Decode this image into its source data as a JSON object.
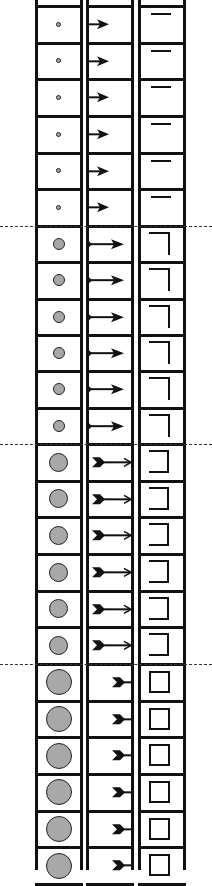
{
  "diagram": {
    "colors": {
      "line": "#111111",
      "dot_fill": "#a8a8a8",
      "background": "#ffffff"
    },
    "columns": [
      {
        "name": "circle-column",
        "x_left": 36,
        "x_right": 81
      },
      {
        "name": "arrow-column",
        "x_left": 87,
        "x_right": 132
      },
      {
        "name": "shape-column",
        "x_left": 139,
        "x_right": 184
      }
    ],
    "dividers_y": [
      226,
      444,
      664
    ],
    "groups": [
      {
        "stage": 1,
        "rows": 6,
        "circle_diameter": 5,
        "arrow": "short-arrow-right",
        "shape": "top-line"
      },
      {
        "stage": 2,
        "rows": 6,
        "circle_diameter": 12,
        "arrow": "long-arrow-with-tail-dot",
        "shape": "corner-bracket"
      },
      {
        "stage": 3,
        "rows": 6,
        "circle_diameter": 19,
        "arrow": "fletched-long-arrow",
        "shape": "open-square"
      },
      {
        "stage": 4,
        "rows": 6,
        "circle_diameter": 26,
        "arrow": "fletched-short-arrow-bar",
        "shape": "closed-square"
      }
    ]
  }
}
